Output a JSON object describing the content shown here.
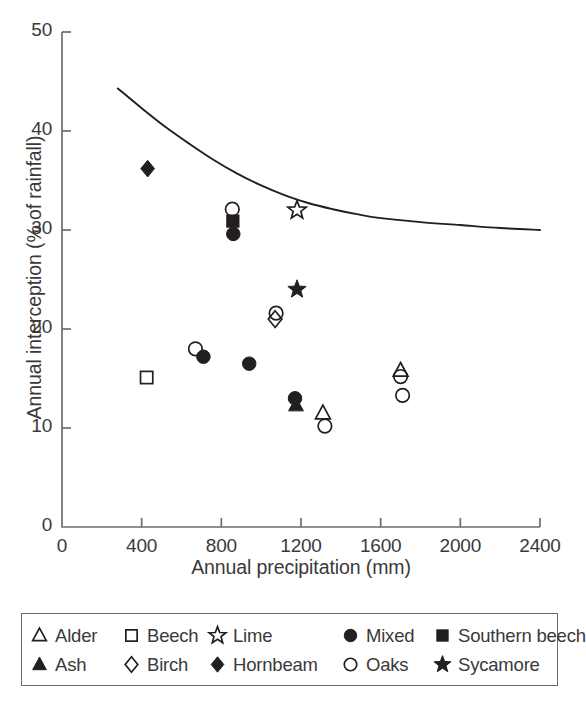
{
  "chart_data": {
    "type": "scatter",
    "title": "",
    "xlabel": "Annual precipitation (mm)",
    "ylabel": "Annual interception (% of rainfall)",
    "xlim": [
      0,
      2400
    ],
    "ylim": [
      0,
      50
    ],
    "xticks": [
      "0",
      "400",
      "800",
      "1200",
      "1600",
      "2000",
      "2400"
    ],
    "yticks": [
      "0",
      "10",
      "20",
      "30",
      "40",
      "50"
    ],
    "xtick_values": [
      0,
      400,
      800,
      1200,
      1600,
      2000,
      2400
    ],
    "ytick_values": [
      0,
      10,
      20,
      30,
      40,
      50
    ],
    "grid": false,
    "legend_position": "below-axes",
    "series": [
      {
        "name": "Alder",
        "marker": "open-triangle",
        "points": [
          {
            "x": 1310,
            "y": 11.5
          },
          {
            "x": 1700,
            "y": 15.8
          }
        ]
      },
      {
        "name": "Ash",
        "marker": "filled-triangle",
        "points": [
          {
            "x": 1175,
            "y": 12.3
          }
        ]
      },
      {
        "name": "Beech",
        "marker": "open-square",
        "points": [
          {
            "x": 425,
            "y": 15.1
          }
        ]
      },
      {
        "name": "Birch",
        "marker": "open-diamond",
        "points": [
          {
            "x": 1070,
            "y": 21.0
          }
        ]
      },
      {
        "name": "Lime",
        "marker": "open-star",
        "points": [
          {
            "x": 1180,
            "y": 32.0
          }
        ]
      },
      {
        "name": "Hornbeam",
        "marker": "filled-diamond",
        "points": [
          {
            "x": 430,
            "y": 36.2
          }
        ]
      },
      {
        "name": "Mixed",
        "marker": "filled-circle",
        "points": [
          {
            "x": 710,
            "y": 17.2
          },
          {
            "x": 860,
            "y": 29.6
          },
          {
            "x": 940,
            "y": 16.5
          },
          {
            "x": 1170,
            "y": 13.0
          }
        ]
      },
      {
        "name": "Oaks",
        "marker": "open-circle",
        "points": [
          {
            "x": 670,
            "y": 18.0
          },
          {
            "x": 855,
            "y": 32.1
          },
          {
            "x": 1075,
            "y": 21.6
          },
          {
            "x": 1320,
            "y": 10.2
          },
          {
            "x": 1700,
            "y": 15.2
          },
          {
            "x": 1710,
            "y": 13.3
          }
        ]
      },
      {
        "name": "Southern beech",
        "marker": "filled-square",
        "points": [
          {
            "x": 858,
            "y": 30.9
          }
        ]
      },
      {
        "name": "Sycamore",
        "marker": "filled-star",
        "points": [
          {
            "x": 1180,
            "y": 24.0
          }
        ]
      }
    ],
    "trend_curve": {
      "name": "fitted interception curve",
      "points": [
        {
          "x": 280,
          "y": 44.3
        },
        {
          "x": 400,
          "y": 42.3
        },
        {
          "x": 520,
          "y": 40.4
        },
        {
          "x": 640,
          "y": 38.7
        },
        {
          "x": 760,
          "y": 37.1
        },
        {
          "x": 880,
          "y": 35.7
        },
        {
          "x": 1000,
          "y": 34.5
        },
        {
          "x": 1120,
          "y": 33.5
        },
        {
          "x": 1240,
          "y": 32.7
        },
        {
          "x": 1360,
          "y": 32.1
        },
        {
          "x": 1480,
          "y": 31.6
        },
        {
          "x": 1600,
          "y": 31.2
        },
        {
          "x": 1800,
          "y": 30.8
        },
        {
          "x": 2000,
          "y": 30.5
        },
        {
          "x": 2200,
          "y": 30.2
        },
        {
          "x": 2400,
          "y": 30.0
        }
      ]
    }
  },
  "legend": {
    "items": [
      {
        "label": "Alder",
        "marker": "open-triangle"
      },
      {
        "label": "Beech",
        "marker": "open-square"
      },
      {
        "label": "Lime",
        "marker": "open-star"
      },
      {
        "label": "Mixed",
        "marker": "filled-circle"
      },
      {
        "label": "Southern beech",
        "marker": "filled-square"
      },
      {
        "label": "Ash",
        "marker": "filled-triangle"
      },
      {
        "label": "Birch",
        "marker": "open-diamond"
      },
      {
        "label": "Hornbeam",
        "marker": "filled-diamond"
      },
      {
        "label": "Oaks",
        "marker": "open-circle"
      },
      {
        "label": "Sycamore",
        "marker": "filled-star"
      }
    ]
  },
  "colors": {
    "ink": "#231f20",
    "axis": "#6d6d6d",
    "text": "#3a3a3a",
    "background": "#ffffff"
  }
}
